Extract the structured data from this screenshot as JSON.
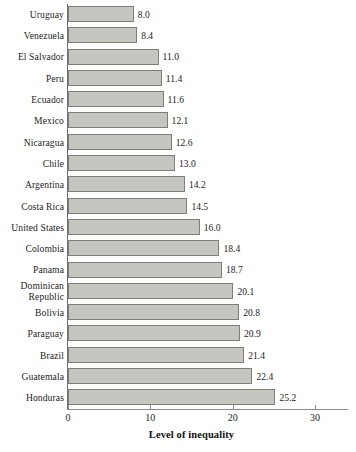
{
  "chart_data": {
    "type": "bar",
    "orientation": "horizontal",
    "title": "",
    "xlabel": "Level of inequality",
    "ylabel": "",
    "xlim": [
      0,
      30
    ],
    "xticks": [
      0,
      10,
      20,
      30
    ],
    "xtick_labels": [
      "0",
      "10",
      "20",
      "30"
    ],
    "grid": false,
    "legend": null,
    "categories": [
      "Uruguay",
      "Venezuela",
      "El Salvador",
      "Peru",
      "Ecuador",
      "Mexico",
      "Nicaragua",
      "Chile",
      "Argentina",
      "Costa Rica",
      "United States",
      "Colombia",
      "Panama",
      "Dominican\nRepublic",
      "Bolivia",
      "Paraguay",
      "Brazil",
      "Guatemala",
      "Honduras"
    ],
    "values": [
      8.0,
      8.4,
      11.0,
      11.4,
      11.6,
      12.1,
      12.6,
      13.0,
      14.2,
      14.5,
      16.0,
      18.4,
      18.7,
      20.1,
      20.8,
      20.9,
      21.4,
      22.4,
      25.2
    ],
    "value_labels": [
      "8.0",
      "8.4",
      "11.0",
      "11.4",
      "11.6",
      "12.1",
      "12.6",
      "13.0",
      "14.2",
      "14.5",
      "16.0",
      "18.4",
      "18.7",
      "20.1",
      "20.8",
      "20.9",
      "21.4",
      "22.4",
      "25.2"
    ],
    "colors": {
      "bar_fill": "#c6c6c1",
      "bar_border": "#7d7d79",
      "axis": "#8a8a8a",
      "text": "#1d1d1d",
      "background": "#ffffff"
    }
  }
}
